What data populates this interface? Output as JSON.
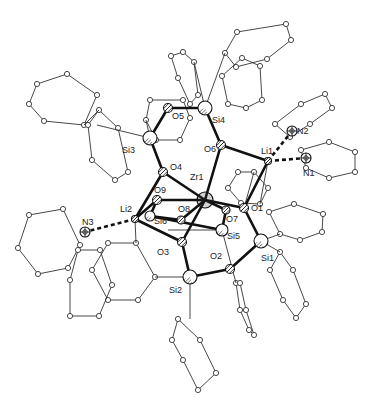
{
  "atoms": [
    {
      "id": "Zr1",
      "label": "Zr1",
      "x": 205,
      "y": 200,
      "r": 8,
      "type": "metal",
      "lx": 190,
      "ly": 173
    },
    {
      "id": "O1",
      "label": "O1",
      "x": 244,
      "y": 208,
      "r": 4.5,
      "type": "O",
      "lx": 251,
      "ly": 204
    },
    {
      "id": "O2",
      "label": "O2",
      "x": 230,
      "y": 269,
      "r": 4.5,
      "type": "O",
      "lx": 210,
      "ly": 252
    },
    {
      "id": "O3",
      "label": "O3",
      "x": 182,
      "y": 242,
      "r": 4.5,
      "type": "O",
      "lx": 157,
      "ly": 248
    },
    {
      "id": "O4",
      "label": "O4",
      "x": 163,
      "y": 172,
      "r": 4.5,
      "type": "O",
      "lx": 170,
      "ly": 163
    },
    {
      "id": "O5",
      "label": "O5",
      "x": 168,
      "y": 108,
      "r": 4.5,
      "type": "O",
      "lx": 172,
      "ly": 112
    },
    {
      "id": "O6",
      "label": "O6",
      "x": 221,
      "y": 145,
      "r": 4.5,
      "type": "O",
      "lx": 204,
      "ly": 145
    },
    {
      "id": "O7",
      "label": "O7",
      "x": 226,
      "y": 210,
      "r": 4,
      "type": "O",
      "lx": 226,
      "ly": 215
    },
    {
      "id": "O8",
      "label": "O8",
      "x": 181,
      "y": 220,
      "r": 4,
      "type": "O",
      "lx": 178,
      "ly": 205
    },
    {
      "id": "O9",
      "label": "O9",
      "x": 157,
      "y": 200,
      "r": 4.5,
      "type": "O",
      "lx": 154,
      "ly": 186
    },
    {
      "id": "Si1",
      "label": "Si1",
      "x": 261,
      "y": 241,
      "r": 7,
      "type": "Si",
      "lx": 261,
      "ly": 254
    },
    {
      "id": "Si2",
      "label": "Si2",
      "x": 190,
      "y": 277,
      "r": 7,
      "type": "Si",
      "lx": 169,
      "ly": 286
    },
    {
      "id": "Si3",
      "label": "Si3",
      "x": 150,
      "y": 138,
      "r": 7,
      "type": "Si",
      "lx": 122,
      "ly": 146
    },
    {
      "id": "Si4",
      "label": "Si4",
      "x": 205,
      "y": 108,
      "r": 7,
      "type": "Si",
      "lx": 212,
      "ly": 116
    },
    {
      "id": "Si5",
      "label": "Si5",
      "x": 222,
      "y": 230,
      "r": 6,
      "type": "Si",
      "lx": 227,
      "ly": 232
    },
    {
      "id": "Si6",
      "label": "Si6",
      "x": 150,
      "y": 216,
      "r": 5,
      "type": "Si",
      "lx": 154,
      "ly": 217
    },
    {
      "id": "Li1",
      "label": "Li1",
      "x": 268,
      "y": 161,
      "r": 3.5,
      "type": "Li",
      "lx": 261,
      "ly": 147
    },
    {
      "id": "Li2",
      "label": "Li2",
      "x": 135,
      "y": 219,
      "r": 3.5,
      "type": "Li",
      "lx": 120,
      "ly": 205
    },
    {
      "id": "N1",
      "label": "N1",
      "x": 306,
      "y": 158,
      "r": 5,
      "type": "N",
      "lx": 303,
      "ly": 169
    },
    {
      "id": "N2",
      "label": "N2",
      "x": 292,
      "y": 131,
      "r": 5,
      "type": "N",
      "lx": 297,
      "ly": 127
    },
    {
      "id": "N3",
      "label": "N3",
      "x": 85,
      "y": 232,
      "r": 5,
      "type": "N",
      "lx": 82,
      "ly": 218
    }
  ],
  "bonds_heavy": [
    [
      "Zr1",
      "O1"
    ],
    [
      "Zr1",
      "O3"
    ],
    [
      "Zr1",
      "O4"
    ],
    [
      "Zr1",
      "O6"
    ],
    [
      "Zr1",
      "O9"
    ],
    [
      "Zr1",
      "O7"
    ],
    [
      "O1",
      "Li1"
    ],
    [
      "O1",
      "Si1"
    ],
    [
      "O6",
      "Li1"
    ],
    [
      "O6",
      "Si4"
    ],
    [
      "O4",
      "Si3"
    ],
    [
      "O4",
      "Li2"
    ],
    [
      "O3",
      "Si2"
    ],
    [
      "O3",
      "Li2"
    ],
    [
      "O2",
      "Si2"
    ],
    [
      "O2",
      "Si1"
    ],
    [
      "O9",
      "Li2"
    ],
    [
      "O9",
      "Si6"
    ],
    [
      "O8",
      "Si6"
    ],
    [
      "O5",
      "Si3"
    ],
    [
      "O5",
      "Si4"
    ],
    [
      "O7",
      "Si5"
    ],
    [
      "Si5",
      "Si6"
    ],
    [
      "O8",
      "Zr1"
    ]
  ],
  "bonds_dashed": [
    [
      "Li1",
      "N1"
    ],
    [
      "Li1",
      "N2"
    ],
    [
      "Li2",
      "N3"
    ]
  ],
  "rings": [
    {
      "name": "ring-si4-upper",
      "pts": [
        [
          237,
          32
        ],
        [
          286,
          24
        ],
        [
          291,
          40
        ],
        [
          267,
          59
        ],
        [
          236,
          67
        ],
        [
          225,
          53
        ]
      ]
    },
    {
      "name": "ring-si4-left",
      "pts": [
        [
          183,
          52
        ],
        [
          194,
          62
        ],
        [
          198,
          95
        ],
        [
          190,
          104
        ],
        [
          178,
          78
        ],
        [
          171,
          56
        ]
      ]
    },
    {
      "name": "ring-left-top",
      "pts": [
        [
          37,
          84
        ],
        [
          67,
          74
        ],
        [
          97,
          95
        ],
        [
          84,
          125
        ],
        [
          44,
          121
        ],
        [
          29,
          104
        ]
      ]
    },
    {
      "name": "ring-si3-a",
      "pts": [
        [
          99,
          110
        ],
        [
          118,
          128
        ],
        [
          128,
          172
        ],
        [
          115,
          180
        ],
        [
          92,
          160
        ],
        [
          88,
          125
        ]
      ]
    },
    {
      "name": "ring-si3-b",
      "pts": [
        [
          150,
          100
        ],
        [
          183,
          100
        ],
        [
          190,
          118
        ],
        [
          180,
          140
        ],
        [
          156,
          140
        ],
        [
          146,
          120
        ]
      ]
    },
    {
      "name": "ring-n3",
      "pts": [
        [
          29,
          215
        ],
        [
          63,
          209
        ],
        [
          80,
          245
        ],
        [
          68,
          268
        ],
        [
          38,
          274
        ],
        [
          18,
          248
        ]
      ]
    },
    {
      "name": "ring-n2",
      "pts": [
        [
          275,
          124
        ],
        [
          301,
          104
        ],
        [
          325,
          94
        ],
        [
          332,
          108
        ],
        [
          310,
          124
        ],
        [
          290,
          137
        ]
      ]
    },
    {
      "name": "ring-n1",
      "pts": [
        [
          301,
          150
        ],
        [
          329,
          142
        ],
        [
          355,
          152
        ],
        [
          355,
          172
        ],
        [
          329,
          178
        ],
        [
          306,
          168
        ]
      ]
    },
    {
      "name": "ring-li1-inner",
      "pts": [
        [
          238,
          172
        ],
        [
          254,
          172
        ],
        [
          268,
          188
        ],
        [
          260,
          204
        ],
        [
          241,
          203
        ],
        [
          228,
          188
        ]
      ]
    },
    {
      "name": "ring-si1-right",
      "pts": [
        [
          269,
          212
        ],
        [
          294,
          204
        ],
        [
          323,
          214
        ],
        [
          322,
          232
        ],
        [
          300,
          240
        ],
        [
          280,
          234
        ]
      ]
    },
    {
      "name": "ring-si1-low",
      "pts": [
        [
          280,
          252
        ],
        [
          293,
          270
        ],
        [
          306,
          304
        ],
        [
          296,
          318
        ],
        [
          283,
          300
        ],
        [
          270,
          270
        ]
      ]
    },
    {
      "name": "ring-li2-low-a",
      "pts": [
        [
          108,
          243
        ],
        [
          136,
          243
        ],
        [
          155,
          277
        ],
        [
          138,
          300
        ],
        [
          108,
          300
        ],
        [
          92,
          270
        ]
      ]
    },
    {
      "name": "ring-li2-low-b",
      "pts": [
        [
          78,
          250
        ],
        [
          100,
          250
        ],
        [
          112,
          285
        ],
        [
          99,
          316
        ],
        [
          70,
          316
        ],
        [
          70,
          280
        ]
      ]
    },
    {
      "name": "ring-si2-low",
      "pts": [
        [
          178,
          319
        ],
        [
          200,
          340
        ],
        [
          216,
          373
        ],
        [
          198,
          390
        ],
        [
          183,
          360
        ],
        [
          172,
          340
        ]
      ]
    },
    {
      "name": "ring-si5-low",
      "pts": [
        [
          236,
          283
        ],
        [
          240,
          310
        ],
        [
          249,
          330
        ],
        [
          254,
          335
        ],
        [
          246,
          310
        ],
        [
          240,
          283
        ]
      ]
    },
    {
      "name": "ring-zr-upper",
      "pts": [
        [
          222,
          76
        ],
        [
          242,
          58
        ],
        [
          260,
          66
        ],
        [
          262,
          100
        ],
        [
          246,
          108
        ],
        [
          228,
          104
        ]
      ]
    }
  ],
  "thin_links": [
    [
      [
        205,
        108
      ],
      [
        225,
        53
      ]
    ],
    [
      [
        205,
        108
      ],
      [
        194,
        62
      ]
    ],
    [
      [
        150,
        138
      ],
      [
        97,
        125
      ]
    ],
    [
      [
        150,
        138
      ],
      [
        146,
        120
      ]
    ],
    [
      [
        261,
        241
      ],
      [
        280,
        234
      ]
    ],
    [
      [
        261,
        241
      ],
      [
        280,
        252
      ]
    ],
    [
      [
        190,
        277
      ],
      [
        155,
        277
      ]
    ],
    [
      [
        190,
        277
      ],
      [
        190,
        319
      ]
    ],
    [
      [
        222,
        230
      ],
      [
        236,
        283
      ]
    ],
    [
      [
        135,
        219
      ],
      [
        136,
        243
      ]
    ],
    [
      [
        244,
        208
      ],
      [
        254,
        172
      ]
    ],
    [
      [
        222,
        230
      ],
      [
        168,
        230
      ]
    ],
    [
      [
        268,
        161
      ],
      [
        260,
        204
      ]
    ],
    [
      [
        99,
        110
      ],
      [
        84,
        125
      ]
    ]
  ],
  "colors": {
    "bond": "#111111",
    "thin": "#333333",
    "atom_fill": "#ffffff",
    "ink": "#222222"
  }
}
